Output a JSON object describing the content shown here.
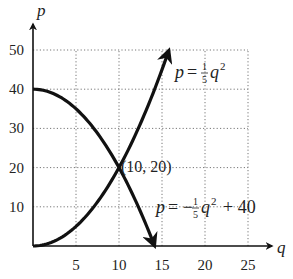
{
  "chart_data": {
    "type": "line",
    "title": "",
    "xlabel": "q",
    "ylabel": "p",
    "xlim": [
      0,
      25
    ],
    "ylim": [
      0,
      50
    ],
    "x_ticks": [
      5,
      10,
      15,
      20,
      25
    ],
    "y_ticks": [
      10,
      20,
      30,
      40,
      50
    ],
    "grid": true,
    "grid_style": "dotted",
    "legend": "none (inline curve labels)",
    "series": [
      {
        "name": "p = (1/5)q^2",
        "label_parts": {
          "lhs": "p",
          "eq": "=",
          "num": "1",
          "den": "5",
          "var": "q",
          "exp": "2",
          "tail": ""
        },
        "x": [
          0,
          2,
          4,
          6,
          8,
          10,
          12,
          14,
          15.8
        ],
        "values": [
          0,
          0.8,
          3.2,
          7.2,
          12.8,
          20,
          28.8,
          39.2,
          50
        ],
        "arrow_end": true
      },
      {
        "name": "p = -(1/5)q^2 + 40",
        "label_parts": {
          "lhs": "p",
          "eq": "= −",
          "num": "1",
          "den": "5",
          "var": "q",
          "exp": "2",
          "tail": "+ 40"
        },
        "x": [
          0,
          2,
          4,
          6,
          8,
          10,
          12,
          14,
          14.14
        ],
        "values": [
          40,
          39.2,
          36.8,
          32.8,
          27.2,
          20,
          11.2,
          0.8,
          0
        ],
        "arrow_end": true
      }
    ],
    "annotations": [
      {
        "text": "(10, 20)",
        "x": 10,
        "y": 20,
        "type": "intersection point"
      }
    ]
  },
  "labels": {
    "x_axis": "q",
    "y_axis": "p",
    "intersection": "(10, 20)",
    "x_ticks": [
      "5",
      "10",
      "15",
      "20",
      "25"
    ],
    "y_ticks": [
      "10",
      "20",
      "30",
      "40",
      "50"
    ]
  }
}
